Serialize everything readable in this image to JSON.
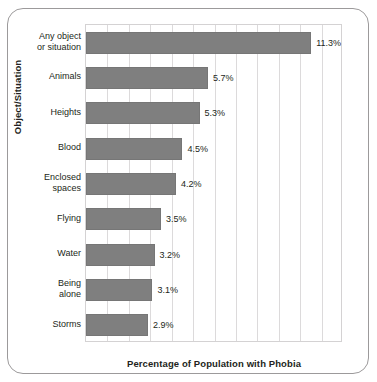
{
  "chart": {
    "type": "bar",
    "orientation": "horizontal",
    "title": "",
    "xlabel": "Percentage of Population with Phobia",
    "ylabel": "Object/Situation"
  },
  "chart_data": {
    "type": "bar",
    "orientation": "horizontal",
    "title": "",
    "xlabel": "Percentage of Population with Phobia",
    "ylabel": "Object/Situation",
    "xlim": [
      0,
      12
    ],
    "grid": true,
    "gridline_interval": 1,
    "legend": "none",
    "categories": [
      "Any object or situation",
      "Animals",
      "Heights",
      "Blood",
      "Enclosed spaces",
      "Flying",
      "Water",
      "Being alone",
      "Storms"
    ],
    "values": [
      11.3,
      5.7,
      5.3,
      4.5,
      4.2,
      3.5,
      3.2,
      3.1,
      2.9
    ],
    "value_labels": [
      "11.3%",
      "5.7%",
      "5.3%",
      "4.5%",
      "4.2%",
      "3.5%",
      "3.2%",
      "3.1%",
      "2.9%"
    ],
    "bars": [
      {
        "line1": "Any object",
        "line2": "or situation",
        "value": 11.3,
        "label": "11.3%"
      },
      {
        "line1": "Animals",
        "line2": "",
        "value": 5.7,
        "label": "5.7%"
      },
      {
        "line1": "Heights",
        "line2": "",
        "value": 5.3,
        "label": "5.3%"
      },
      {
        "line1": "Blood",
        "line2": "",
        "value": 4.5,
        "label": "4.5%"
      },
      {
        "line1": "Enclosed",
        "line2": "spaces",
        "value": 4.2,
        "label": "4.2%"
      },
      {
        "line1": "Flying",
        "line2": "",
        "value": 3.5,
        "label": "3.5%"
      },
      {
        "line1": "Water",
        "line2": "",
        "value": 3.2,
        "label": "3.2%"
      },
      {
        "line1": "Being",
        "line2": "alone",
        "value": 3.1,
        "label": "3.1%"
      },
      {
        "line1": "Storms",
        "line2": "",
        "value": 2.9,
        "label": "2.9%"
      }
    ],
    "colors": {
      "bar_fill": "#7f7f7f",
      "bar_border": "#767676",
      "gridline": "#dcdadb",
      "plot_border": "#d4d2d3",
      "frame_border": "#9c9a9b",
      "text": "#231f20",
      "background": "#ffffff"
    }
  }
}
